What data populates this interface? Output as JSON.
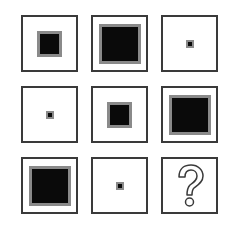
{
  "puzzle": {
    "type": "3x3 matrix reasoning",
    "rows": [
      [
        "medium",
        "large",
        "small"
      ],
      [
        "small",
        "medium",
        "large"
      ],
      [
        "large",
        "small",
        "?"
      ]
    ],
    "colors": {
      "frame": "#3a3a3a",
      "fill": "#0a0a0a",
      "halo": "#8a8a8a"
    },
    "missing_cell_icon": "question-mark-icon"
  }
}
